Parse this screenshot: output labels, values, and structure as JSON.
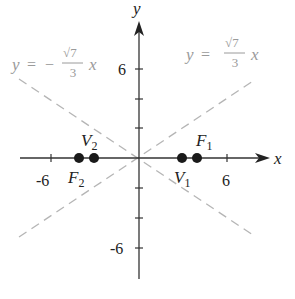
{
  "diagram": {
    "type": "hyperbola-graph",
    "axes": {
      "x_label": "x",
      "y_label": "y",
      "x_ticks": [
        "-6",
        "6"
      ],
      "y_ticks": [
        "6",
        "-6"
      ]
    },
    "asymptotes": [
      {
        "label_lhs": "y =",
        "sign": "−",
        "num": "√7",
        "den": "3",
        "var": "x",
        "slope": -0.8819
      },
      {
        "label_lhs": "y =",
        "sign": "",
        "num": "√7",
        "den": "3",
        "var": "x",
        "slope": 0.8819
      }
    ],
    "points": [
      {
        "name": "F",
        "sub": "2",
        "x": -4,
        "y": 0
      },
      {
        "name": "V",
        "sub": "2",
        "x": -3,
        "y": 0
      },
      {
        "name": "V",
        "sub": "1",
        "x": 3,
        "y": 0
      },
      {
        "name": "F",
        "sub": "1",
        "x": 4,
        "y": 0
      }
    ],
    "colors": {
      "axis": "#333333",
      "asymptote": "#b5b5b5",
      "asymptote_label": "#9a9a9a",
      "point": "#1a1a1a"
    }
  }
}
